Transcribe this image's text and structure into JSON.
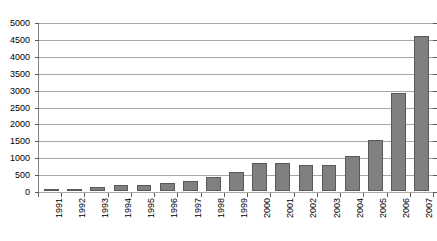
{
  "chart_data": {
    "type": "bar",
    "title": "",
    "subtitle": "",
    "xlabel": "",
    "ylabel": "",
    "categories": [
      "1991",
      "1992",
      "1993",
      "1994",
      "1995",
      "1996",
      "1997",
      "1998",
      "1999",
      "2000",
      "2001",
      "2002",
      "2003",
      "2004",
      "2005",
      "2006",
      "2007"
    ],
    "values": [
      30,
      60,
      110,
      170,
      180,
      230,
      300,
      420,
      560,
      830,
      820,
      760,
      760,
      1050,
      1500,
      2900,
      4600
    ],
    "series": [
      {
        "name": "Count",
        "values": [
          30,
          60,
          110,
          170,
          180,
          230,
          300,
          420,
          560,
          830,
          820,
          760,
          760,
          1050,
          1500,
          2900,
          4600
        ]
      }
    ],
    "ylim": [
      0,
      5000
    ],
    "y_ticks": [
      0,
      500,
      1000,
      1500,
      2000,
      2500,
      3000,
      3500,
      4000,
      4500,
      5000
    ],
    "y_tick_labels": [
      "0",
      "500",
      "1000",
      "1500",
      "2000",
      "2500",
      "3000",
      "3500",
      "4000",
      "4500",
      "5000"
    ],
    "grid": "horizontal",
    "legend": "none",
    "bar_color": "#808080",
    "bar_border_color": "#595959",
    "gridline_color": "#a8a8a8",
    "axis_color": "#5a5a5a",
    "background_color": "#ffffff",
    "x_label_rotation": -90
  }
}
